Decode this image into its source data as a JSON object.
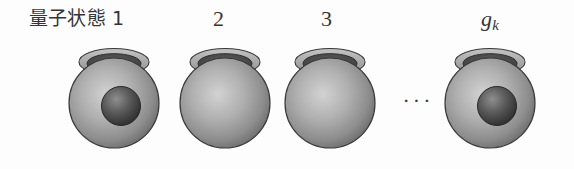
{
  "figure": {
    "title_text": "量子状態",
    "ellipsis": "···",
    "colors": {
      "background": "#fdfdfd",
      "text": "#353535",
      "sphere_light": "#c9c9c9",
      "sphere_mid": "#9a9a9a",
      "sphere_dark": "#5f5f5f",
      "outline": "#3a3a3a",
      "rim_light": "#b8b8b8",
      "opening_dark": "#4a4a4a",
      "particle_light": "#8a8a8a",
      "particle_dark": "#2e2e2e"
    },
    "cells": [
      {
        "id": "cell-1",
        "label": "量子状態 1",
        "label_kind": "cjk-number",
        "index_text": "1",
        "occupied": true,
        "particle_count": 1
      },
      {
        "id": "cell-2",
        "label": "2",
        "label_kind": "number",
        "index_text": "2",
        "occupied": false,
        "particle_count": 0
      },
      {
        "id": "cell-3",
        "label": "3",
        "label_kind": "number",
        "index_text": "3",
        "occupied": false,
        "particle_count": 0
      },
      {
        "id": "cell-4",
        "label": "g_k",
        "label_kind": "italic-subscript",
        "index_base": "g",
        "index_sub": "k",
        "occupied": true,
        "particle_count": 1
      }
    ]
  }
}
